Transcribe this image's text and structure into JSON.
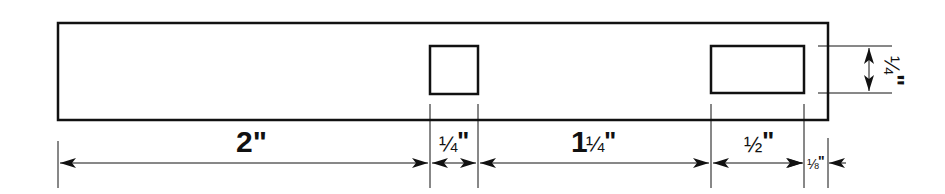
{
  "diagram": {
    "type": "technical-drawing",
    "line_color": "#111111",
    "background": "#ffffff"
  },
  "dimensions": {
    "segment_1": "2\"",
    "segment_2": "¼\"",
    "segment_3": "1¼\"",
    "segment_4": "½\"",
    "segment_5": "⅛\"",
    "hole_height": "¼\""
  },
  "labels": {
    "seg1_main": "2\"",
    "seg2_frac": "¼",
    "seg2_unit": "\"",
    "seg3_whole": "1",
    "seg3_frac": "¼",
    "seg3_unit": "\"",
    "seg4_frac": "½",
    "seg4_unit": "\"",
    "seg5_frac": "⅛",
    "seg5_unit": "\"",
    "height_frac": "¼",
    "height_unit": "\""
  }
}
